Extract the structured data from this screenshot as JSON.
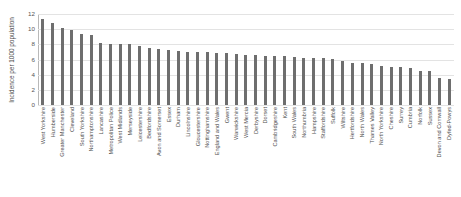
{
  "chart_data": {
    "type": "bar",
    "title": "",
    "xlabel": "",
    "ylabel": "Incidence per 1000 population",
    "ylim": [
      0,
      12
    ],
    "yticks": [
      0,
      2,
      4,
      6,
      8,
      10,
      12
    ],
    "grid": true,
    "legend": "none",
    "bar_color": "#6e6e6e",
    "categories": [
      "West Yorkshire",
      "Humberside",
      "Greater Manchester",
      "Cleveland",
      "South Yorkshire",
      "Northamptonshire",
      "Lancashire",
      "Metropolitan Police",
      "West Midlands",
      "Merseyside",
      "Leicestershire",
      "Bedfordshire",
      "Avon and Somerset",
      "Essex",
      "Durham",
      "Lincolnshire",
      "Gloucestershire",
      "Nottinghamshire",
      "England and Wales",
      "Gwent",
      "Warwickshire",
      "West Mercia",
      "Derbyshire",
      "Dorset",
      "Cambridgeshire",
      "Kent",
      "South Wales",
      "Northumbria",
      "Hampshire",
      "Staffordshire",
      "Suffolk",
      "Wiltshire",
      "Hertfordshire",
      "North Wales",
      "Thames Valley",
      "North Yorkshire",
      "Cheshire",
      "Surrey",
      "Cumbria",
      "Norfolk",
      "Sussex",
      "Devon and Cornwall",
      "Dyfed-Powys"
    ],
    "values": [
      11.3,
      10.8,
      10.2,
      9.85,
      9.3,
      9.25,
      8.15,
      8.05,
      8.05,
      8.0,
      7.75,
      7.5,
      7.35,
      7.2,
      7.1,
      7.05,
      7.0,
      6.95,
      6.9,
      6.8,
      6.7,
      6.65,
      6.6,
      6.5,
      6.45,
      6.4,
      6.3,
      6.2,
      6.15,
      6.15,
      6.05,
      5.8,
      5.6,
      5.55,
      5.4,
      5.1,
      5.0,
      5.0,
      4.85,
      4.5,
      4.5,
      3.6,
      3.4
    ]
  }
}
